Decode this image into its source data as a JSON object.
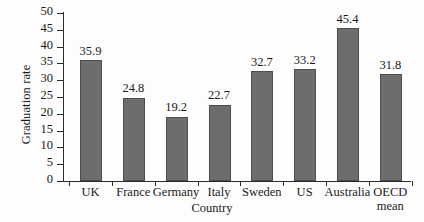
{
  "chart_data": {
    "type": "bar",
    "title": "",
    "xlabel": "Country",
    "ylabel": "Graduation rate",
    "categories": [
      "UK",
      "France",
      "Germany",
      "Italy",
      "Sweden",
      "US",
      "Australia",
      "OECD mean"
    ],
    "values": [
      35.9,
      24.8,
      19.2,
      22.7,
      32.7,
      33.2,
      45.4,
      31.8
    ],
    "data_labels": [
      "35.9",
      "24.8",
      "19.2",
      "22.7",
      "32.7",
      "33.2",
      "45.4",
      "31.8"
    ],
    "ylim": [
      0,
      50
    ],
    "ytick_step": 5,
    "ytick_labels": [
      "50",
      "45",
      "40",
      "35",
      "30",
      "25",
      "20",
      "15",
      "10",
      "5",
      "0"
    ],
    "grid": false,
    "legend": false,
    "legend_position": "none",
    "bar_color": "#6d6d6d",
    "axis_color": "#2b2b2b",
    "background_color": "#fdfdfd"
  },
  "category_lines": [
    {
      "line1": "UK",
      "line2": ""
    },
    {
      "line1": "France",
      "line2": ""
    },
    {
      "line1": "Germany",
      "line2": ""
    },
    {
      "line1": "Italy",
      "line2": ""
    },
    {
      "line1": "Sweden",
      "line2": ""
    },
    {
      "line1": "US",
      "line2": ""
    },
    {
      "line1": "Australia",
      "line2": ""
    },
    {
      "line1": "OECD",
      "line2": "mean"
    }
  ]
}
